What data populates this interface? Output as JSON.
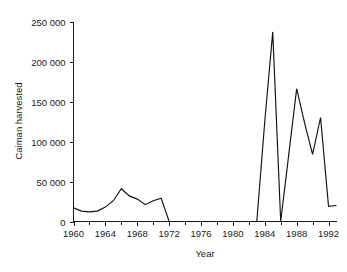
{
  "chart_data": {
    "type": "line",
    "title": "",
    "xlabel": "Year",
    "ylabel": "Caiman harvested",
    "xlim": [
      1960,
      1993
    ],
    "ylim": [
      0,
      250000
    ],
    "grid": false,
    "legend": null,
    "x_tick_labels": [
      "1960",
      "1964",
      "1968",
      "1972",
      "1976",
      "1980",
      "1984",
      "1988",
      "1992"
    ],
    "x_tick_values": [
      1960,
      1964,
      1968,
      1972,
      1976,
      1980,
      1984,
      1988,
      1992
    ],
    "x_minor_tick_values": [
      1960,
      1962,
      1964,
      1966,
      1968,
      1970,
      1972,
      1974,
      1976,
      1978,
      1980,
      1982,
      1984,
      1986,
      1988,
      1990,
      1992
    ],
    "y_tick_labels": [
      "0",
      "50 000",
      "100 000",
      "150 000",
      "200 000",
      "250 000"
    ],
    "y_tick_values": [
      0,
      50000,
      100000,
      150000,
      200000,
      250000
    ],
    "line_color": "#111111",
    "background_color": "#ffffff",
    "series": [
      {
        "name": "Caiman harvested",
        "x": [
          1960,
          1961,
          1962,
          1963,
          1964,
          1965,
          1966,
          1967,
          1968,
          1969,
          1970,
          1971,
          1972,
          1973,
          1974,
          1975,
          1976,
          1977,
          1978,
          1979,
          1980,
          1981,
          1982,
          1983,
          1984,
          1985,
          1986,
          1987,
          1988,
          1989,
          1990,
          1991,
          1992,
          1993
        ],
        "values": [
          17000,
          13000,
          12000,
          13000,
          18000,
          26000,
          41000,
          32000,
          28000,
          21000,
          26000,
          29000,
          0,
          0,
          0,
          0,
          0,
          0,
          0,
          0,
          0,
          0,
          0,
          0,
          125000,
          237000,
          0,
          83000,
          166000,
          123000,
          84000,
          130000,
          19000,
          20000
        ]
      }
    ]
  },
  "axes": {
    "x_axis_title": "Year",
    "y_axis_title": "Caiman harvested"
  }
}
